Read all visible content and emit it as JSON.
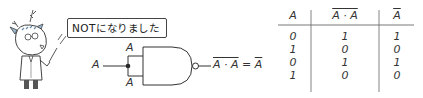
{
  "speech_bubble": {
    "text": "NOTになりました"
  },
  "circuit": {
    "gate_type": "NAND",
    "input_label": "A",
    "branch_top_label": "A",
    "branch_bottom_label": "A",
    "output_expression": {
      "lhs": "A · A",
      "equals": "=",
      "rhs": "A",
      "lhs_overlined": true,
      "rhs_overlined": true
    }
  },
  "truth_table": {
    "headers": [
      {
        "text": "A",
        "overline": false
      },
      {
        "text": "A · A",
        "overline": true
      },
      {
        "text": "A",
        "overline": true
      }
    ],
    "rows": [
      [
        "0",
        "1",
        "1"
      ],
      [
        "1",
        "0",
        "0"
      ],
      [
        "0",
        "1",
        "1"
      ],
      [
        "1",
        "0",
        "0"
      ]
    ]
  },
  "colors": {
    "line": "#333333",
    "background": "#ffffff"
  }
}
